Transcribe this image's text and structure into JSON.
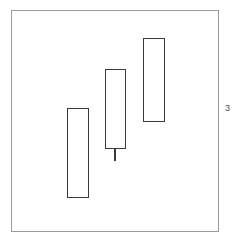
{
  "figure": {
    "width": 233,
    "height": 245,
    "background": "#ffffff"
  },
  "frame": {
    "name": "plot-frame",
    "x": 11,
    "y": 10,
    "width": 208,
    "height": 222,
    "border_color": "#9a9a9a",
    "border_width": 1,
    "fill": "#ffffff"
  },
  "edge_label": {
    "text": "3",
    "x": 225,
    "y": 104,
    "color": "#4a4a4a",
    "clipped": true
  },
  "style": {
    "body_stroke": "#3a3a3a",
    "body_fill": "#ffffff",
    "body_stroke_width": 1.6,
    "wick_color": "#3a3a3a",
    "wick_width": 2
  },
  "chart_data": {
    "type": "candlestick",
    "title": "",
    "xlabel": "",
    "ylabel": "",
    "grid": false,
    "legend": "none",
    "axis_visible": false,
    "orientation": "vertical",
    "note": "Three hollow rising candlestick bodies; only the middle candle has a lower wick.",
    "categories": [
      "1",
      "2",
      "3"
    ],
    "candles": [
      {
        "index": 1,
        "name": "candle-1",
        "body_x": 67,
        "body_y": 108,
        "body_width": 22,
        "body_height": 90,
        "hollow": true,
        "upper_wick": null,
        "lower_wick": null
      },
      {
        "index": 2,
        "name": "candle-2",
        "body_x": 105,
        "body_y": 69,
        "body_width": 21,
        "body_height": 80,
        "hollow": true,
        "upper_wick": null,
        "lower_wick": {
          "center_x": 115,
          "top_y": 149,
          "bottom_y": 161,
          "length": 12
        }
      },
      {
        "index": 3,
        "name": "candle-3",
        "body_x": 143,
        "body_y": 38,
        "body_width": 22,
        "body_height": 84,
        "hollow": true,
        "upper_wick": null,
        "lower_wick": null
      }
    ]
  }
}
